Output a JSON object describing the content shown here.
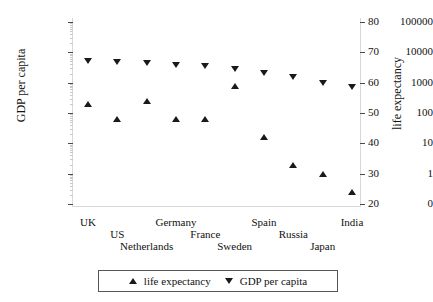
{
  "chart_data": {
    "type": "scatter",
    "title": "",
    "categories": [
      "UK",
      "US",
      "Netherlands",
      "Germany",
      "France",
      "Sweden",
      "Spain",
      "Russia",
      "Japan",
      "India"
    ],
    "series": [
      {
        "name": "GDP per capita",
        "marker": "down-triangle",
        "axis": "left",
        "values": [
          5000,
          4700,
          4300,
          3800,
          3500,
          2800,
          2100,
          1500,
          1000,
          700
        ]
      },
      {
        "name": "life expectancy",
        "marker": "up-triangle",
        "axis": "right",
        "values": [
          53,
          48,
          54,
          48,
          48,
          59,
          42,
          33,
          30,
          24
        ]
      }
    ],
    "left_axis": {
      "label": "GDP per capita",
      "scale": "log",
      "ticks": [
        "100000",
        "10000",
        "1000",
        "100",
        "10",
        "1",
        "0"
      ],
      "ylim": [
        0,
        100000
      ]
    },
    "right_axis": {
      "label": "life expectancy",
      "scale": "linear",
      "ticks": [
        "80",
        "70",
        "60",
        "50",
        "40",
        "30",
        "20"
      ],
      "ylim": [
        20,
        80
      ]
    },
    "legend": {
      "position": "bottom",
      "entries": [
        {
          "label": "life expectancy",
          "marker": "up-triangle"
        },
        {
          "label": "GDP per capita",
          "marker": "down-triangle"
        }
      ]
    },
    "grid": false,
    "marker_color": "#1a1a1a"
  }
}
